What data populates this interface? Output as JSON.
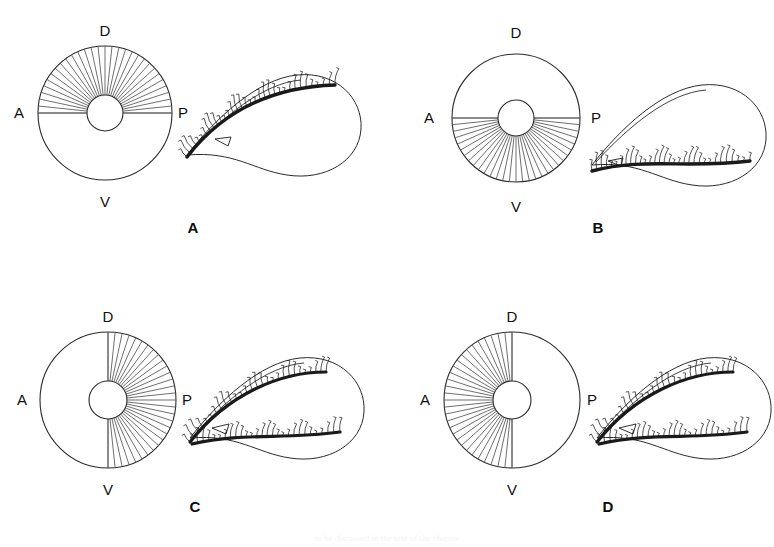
{
  "figure": {
    "background_color": "#ffffff",
    "ink_color": "#1a1a1a",
    "spoke_color": "#555555",
    "outline_color": "#2b2b2b",
    "width": 774,
    "height": 547,
    "caption_partial": "to be discussed in the text of the chapter"
  },
  "axis_labels": {
    "dorsal": "D",
    "ventral": "V",
    "anterior": "A",
    "posterior": "P"
  },
  "panels": [
    {
      "id": "panel-a",
      "letter": "A",
      "letter_x": 193,
      "letter_y": 233,
      "circle": {
        "cx": 105,
        "cy": 113,
        "outer_r": 67,
        "hub_r": 18,
        "label_d_x": 105,
        "label_d_y": 36,
        "label_v_x": 105,
        "label_v_y": 207,
        "label_a_x": 19,
        "label_a_y": 118,
        "label_p_x": 183,
        "label_p_y": 118
      },
      "sector": {
        "start_deg": 180,
        "end_deg": 360,
        "spoke_count": 31,
        "region": "ventral"
      },
      "diameter_line": "horizontal",
      "organism": {
        "cx": 275,
        "cy": 125,
        "bristle_bands": 1,
        "band_position": "dorsal",
        "orientation": "comma-right"
      }
    },
    {
      "id": "panel-b",
      "letter": "B",
      "letter_x": 598,
      "letter_y": 233,
      "circle": {
        "cx": 516,
        "cy": 118,
        "outer_r": 64,
        "hub_r": 18,
        "label_d_x": 516,
        "label_d_y": 38,
        "label_v_x": 516,
        "label_v_y": 212,
        "label_a_x": 429,
        "label_a_y": 123,
        "label_p_x": 596,
        "label_p_y": 123
      },
      "sector": {
        "start_deg": 0,
        "end_deg": 180,
        "spoke_count": 31,
        "region": "dorsal"
      },
      "diameter_line": "horizontal",
      "organism": {
        "cx": 680,
        "cy": 135,
        "bristle_bands": 1,
        "band_position": "ventral",
        "orientation": "comma-right"
      }
    },
    {
      "id": "panel-c",
      "letter": "C",
      "letter_x": 195,
      "letter_y": 512,
      "circle": {
        "cx": 108,
        "cy": 400,
        "outer_r": 68,
        "hub_r": 19,
        "label_d_x": 108,
        "label_d_y": 322,
        "label_v_x": 108,
        "label_v_y": 495,
        "label_a_x": 22,
        "label_a_y": 405,
        "label_p_x": 187,
        "label_p_y": 405
      },
      "sector": {
        "start_deg": 270,
        "end_deg": 450,
        "spoke_count": 31,
        "region": "posterior"
      },
      "diameter_line": "vertical",
      "organism": {
        "cx": 278,
        "cy": 408,
        "bristle_bands": 2,
        "band_position": "both",
        "orientation": "comma-right"
      }
    },
    {
      "id": "panel-d",
      "letter": "D",
      "letter_x": 608,
      "letter_y": 512,
      "circle": {
        "cx": 512,
        "cy": 400,
        "outer_r": 68,
        "hub_r": 19,
        "label_d_x": 512,
        "label_d_y": 322,
        "label_v_x": 512,
        "label_v_y": 495,
        "label_a_x": 425,
        "label_a_y": 405,
        "label_p_x": 592,
        "label_p_y": 405
      },
      "sector": {
        "start_deg": 90,
        "end_deg": 270,
        "spoke_count": 31,
        "region": "anterior"
      },
      "diameter_line": "vertical",
      "organism": {
        "cx": 685,
        "cy": 408,
        "bristle_bands": 2,
        "band_position": "both",
        "orientation": "comma-right"
      }
    }
  ]
}
